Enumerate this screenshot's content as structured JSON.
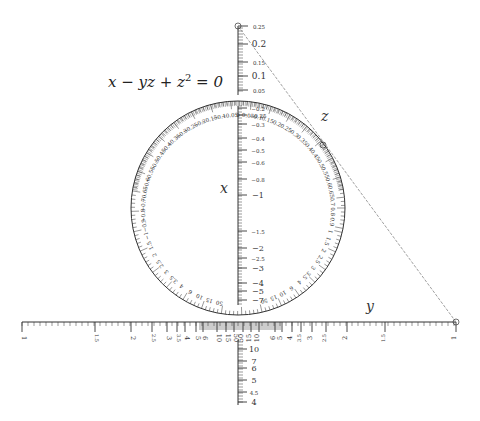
{
  "equation": {
    "lhs_parts": [
      "x − yz + z",
      "2",
      " = 0"
    ]
  },
  "axis_labels": {
    "x": "x",
    "y": "y",
    "z": "z"
  },
  "colors": {
    "ink": "#333333",
    "isopleth": "#888888",
    "background": "#ffffff"
  },
  "z_scale": {
    "labels": [
      "0.25",
      "0.2",
      "0.15",
      "0.1",
      "0.05"
    ],
    "label_y": [
      26,
      44,
      62,
      76,
      90
    ]
  },
  "x_inner_scale": {
    "labels": [
      "−0.2",
      "−0.25",
      "−0.3",
      "−0.4",
      "−0.5",
      "−0.6",
      "−0.8",
      "−1",
      "−1.5",
      "−2",
      "−2.5",
      "−3",
      "−4",
      "−5",
      "−7",
      "10",
      "7",
      "6",
      "5",
      "4.5",
      "4"
    ],
    "label_y": [
      108,
      115,
      124,
      138,
      150,
      162,
      179,
      195,
      231,
      248,
      258,
      268,
      283,
      291,
      300,
      349,
      361,
      368,
      380,
      392,
      402
    ]
  },
  "circle_left_labels": [
    "−0.05",
    "−0.1",
    "−0.15",
    "−0.2",
    "−0.25",
    "−0.3",
    "−0.35",
    "−0.4",
    "−0.45",
    "−0.5",
    "−0.55",
    "−0.6",
    "−0.65",
    "−0.7",
    "−0.8",
    "−0.9",
    "−1",
    "1.5",
    "2",
    "2.5",
    "3",
    "3.5",
    "4",
    "6",
    "10",
    "15",
    "50"
  ],
  "circle_right_labels": [
    "0",
    "0.05",
    "0.1",
    "0.15",
    "0.2",
    "0.25",
    "0.3",
    "0.35",
    "0.4",
    "0.45",
    "0.5",
    "0.55",
    "0.6",
    "0.65",
    "0.7",
    "0.8",
    "0.9",
    "1",
    "1.5",
    "2",
    "2.5",
    "3",
    "3.5",
    "4",
    "6",
    "10",
    "15",
    "50"
  ],
  "y_scale_left": {
    "labels": [
      "1",
      "1.5",
      "2",
      "2.5",
      "3",
      "3.5",
      "4",
      "5",
      "6",
      "10",
      "15",
      "50"
    ],
    "x": [
      22,
      95,
      131,
      152,
      167,
      177,
      185,
      196,
      203,
      217,
      226,
      234
    ]
  },
  "y_scale_right": {
    "labels": [
      "50",
      "15",
      "10",
      "6",
      "5",
      "4",
      "3.5",
      "3",
      "2.5",
      "2",
      "1.5",
      "1"
    ],
    "x": [
      243,
      251,
      259,
      275,
      282,
      292,
      301,
      312,
      326,
      347,
      385,
      456
    ]
  },
  "isopleth": {
    "from": [
      238,
      26
    ],
    "to": [
      456,
      322
    ],
    "mid_marker": [
      323,
      145
    ]
  }
}
